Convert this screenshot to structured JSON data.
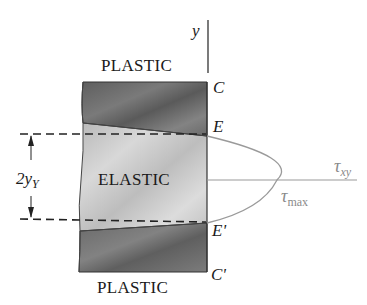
{
  "figure": {
    "regions": {
      "top_plastic_label": "PLASTIC",
      "elastic_label": "ELASTIC",
      "bottom_plastic_label": "PLASTIC"
    },
    "points": {
      "C": "C",
      "E": "E",
      "E_prime": "E'",
      "C_prime": "C'"
    },
    "axes": {
      "vertical_axis_label": "y",
      "horizontal_axis_label_base": "τ",
      "horizontal_axis_label_sub": "xy"
    },
    "annotations": {
      "max_stress_base": "τ",
      "max_stress_sub": "max",
      "elastic_core_dim_prefix": "2y",
      "elastic_core_dim_sub": "Y"
    },
    "colors": {
      "plastic_fill": "#6e6e6e",
      "elastic_fill": "#c4c4c4",
      "curve_stroke": "#9a9a9a",
      "dashed_line": "#222222",
      "text": "#1a1a1a",
      "tau_max_text": "#8a8a8a"
    }
  }
}
